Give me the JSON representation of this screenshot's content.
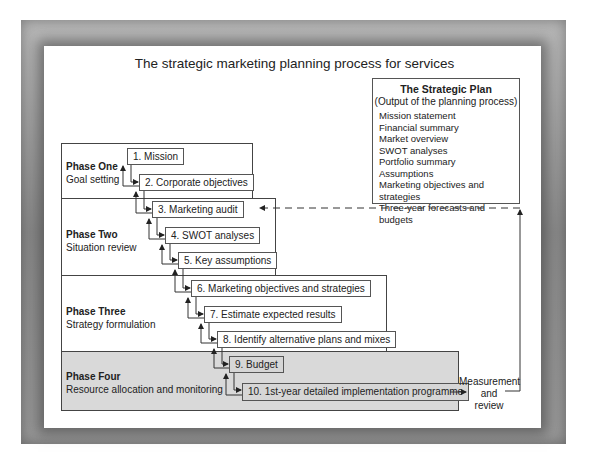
{
  "title": "The strategic marketing planning process for services",
  "phases": [
    {
      "name": "Phase One",
      "description": "Goal setting"
    },
    {
      "name": "Phase Two",
      "description": "Situation review"
    },
    {
      "name": "Phase Three",
      "description": "Strategy formulation"
    },
    {
      "name": "Phase Four",
      "description": "Resource allocation and monitoring"
    }
  ],
  "steps": [
    "1. Mission",
    "2. Corporate objectives",
    "3. Marketing audit",
    "4. SWOT analyses",
    "5. Key assumptions",
    "6. Marketing objectives and strategies",
    "7. Estimate expected results",
    "8. Identify alternative plans and mixes",
    "9. Budget",
    "10. 1st-year detailed implementation programme"
  ],
  "strategic_plan": {
    "heading": "The Strategic Plan",
    "subheading": "(Output of the planning process)",
    "items": [
      "Mission statement",
      "Financial summary",
      "Market overview",
      "SWOT analyses",
      "Portfolio summary",
      "Assumptions",
      "Marketing objectives and strategies",
      "Three-year forecasts and budgets"
    ]
  },
  "feedback": {
    "line1": "Measurement",
    "line2": "and",
    "line3": "review"
  }
}
